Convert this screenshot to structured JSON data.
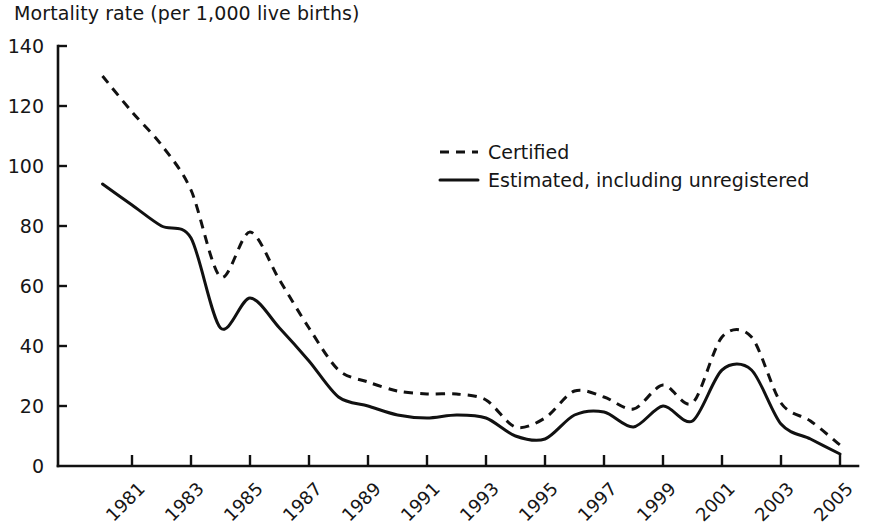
{
  "chart_data": {
    "type": "line",
    "title": "Mortality rate (per 1,000 live births)",
    "xlabel": "",
    "ylabel": "Mortality rate (per 1,000 live births)",
    "ylim": [
      0,
      140
    ],
    "xlim": [
      1980,
      2005
    ],
    "grid": false,
    "legend_position": "upper-center-right",
    "ytick_labels": [
      "0",
      "20",
      "40",
      "60",
      "80",
      "100",
      "120",
      "140"
    ],
    "ytick_values": [
      0,
      20,
      40,
      60,
      80,
      100,
      120,
      140
    ],
    "xtick_labels": [
      "1981",
      "1983",
      "1985",
      "1987",
      "1989",
      "1991",
      "1993",
      "1995",
      "1997",
      "1999",
      "2001",
      "2003",
      "2005"
    ],
    "xtick_values": [
      1981,
      1983,
      1985,
      1987,
      1989,
      1991,
      1993,
      1995,
      1997,
      1999,
      2001,
      2003,
      2005
    ],
    "x": [
      1980,
      1981,
      1982,
      1983,
      1984,
      1985,
      1986,
      1987,
      1988,
      1989,
      1990,
      1991,
      1992,
      1993,
      1994,
      1995,
      1996,
      1997,
      1998,
      1999,
      2000,
      2001,
      2002,
      2003,
      2004,
      2005
    ],
    "series": [
      {
        "name": "Certified",
        "style": "dashed",
        "color": "#111111",
        "values": [
          130,
          118,
          107,
          92,
          63,
          78,
          62,
          46,
          32,
          28,
          25,
          24,
          24,
          22,
          13,
          16,
          25,
          23,
          19,
          27,
          21,
          43,
          43,
          21,
          15,
          7
        ]
      },
      {
        "name": "Estimated, including unregistered",
        "style": "solid",
        "color": "#111111",
        "values": [
          94,
          87,
          80,
          76,
          46,
          56,
          46,
          35,
          23,
          20,
          17,
          16,
          17,
          16,
          10,
          9,
          17,
          18,
          13,
          20,
          15,
          32,
          32,
          14,
          9,
          4
        ]
      }
    ]
  },
  "legend": {
    "items": [
      {
        "label": "Certified",
        "style": "dashed"
      },
      {
        "label": "Estimated, including unregistered",
        "style": "solid"
      }
    ]
  }
}
